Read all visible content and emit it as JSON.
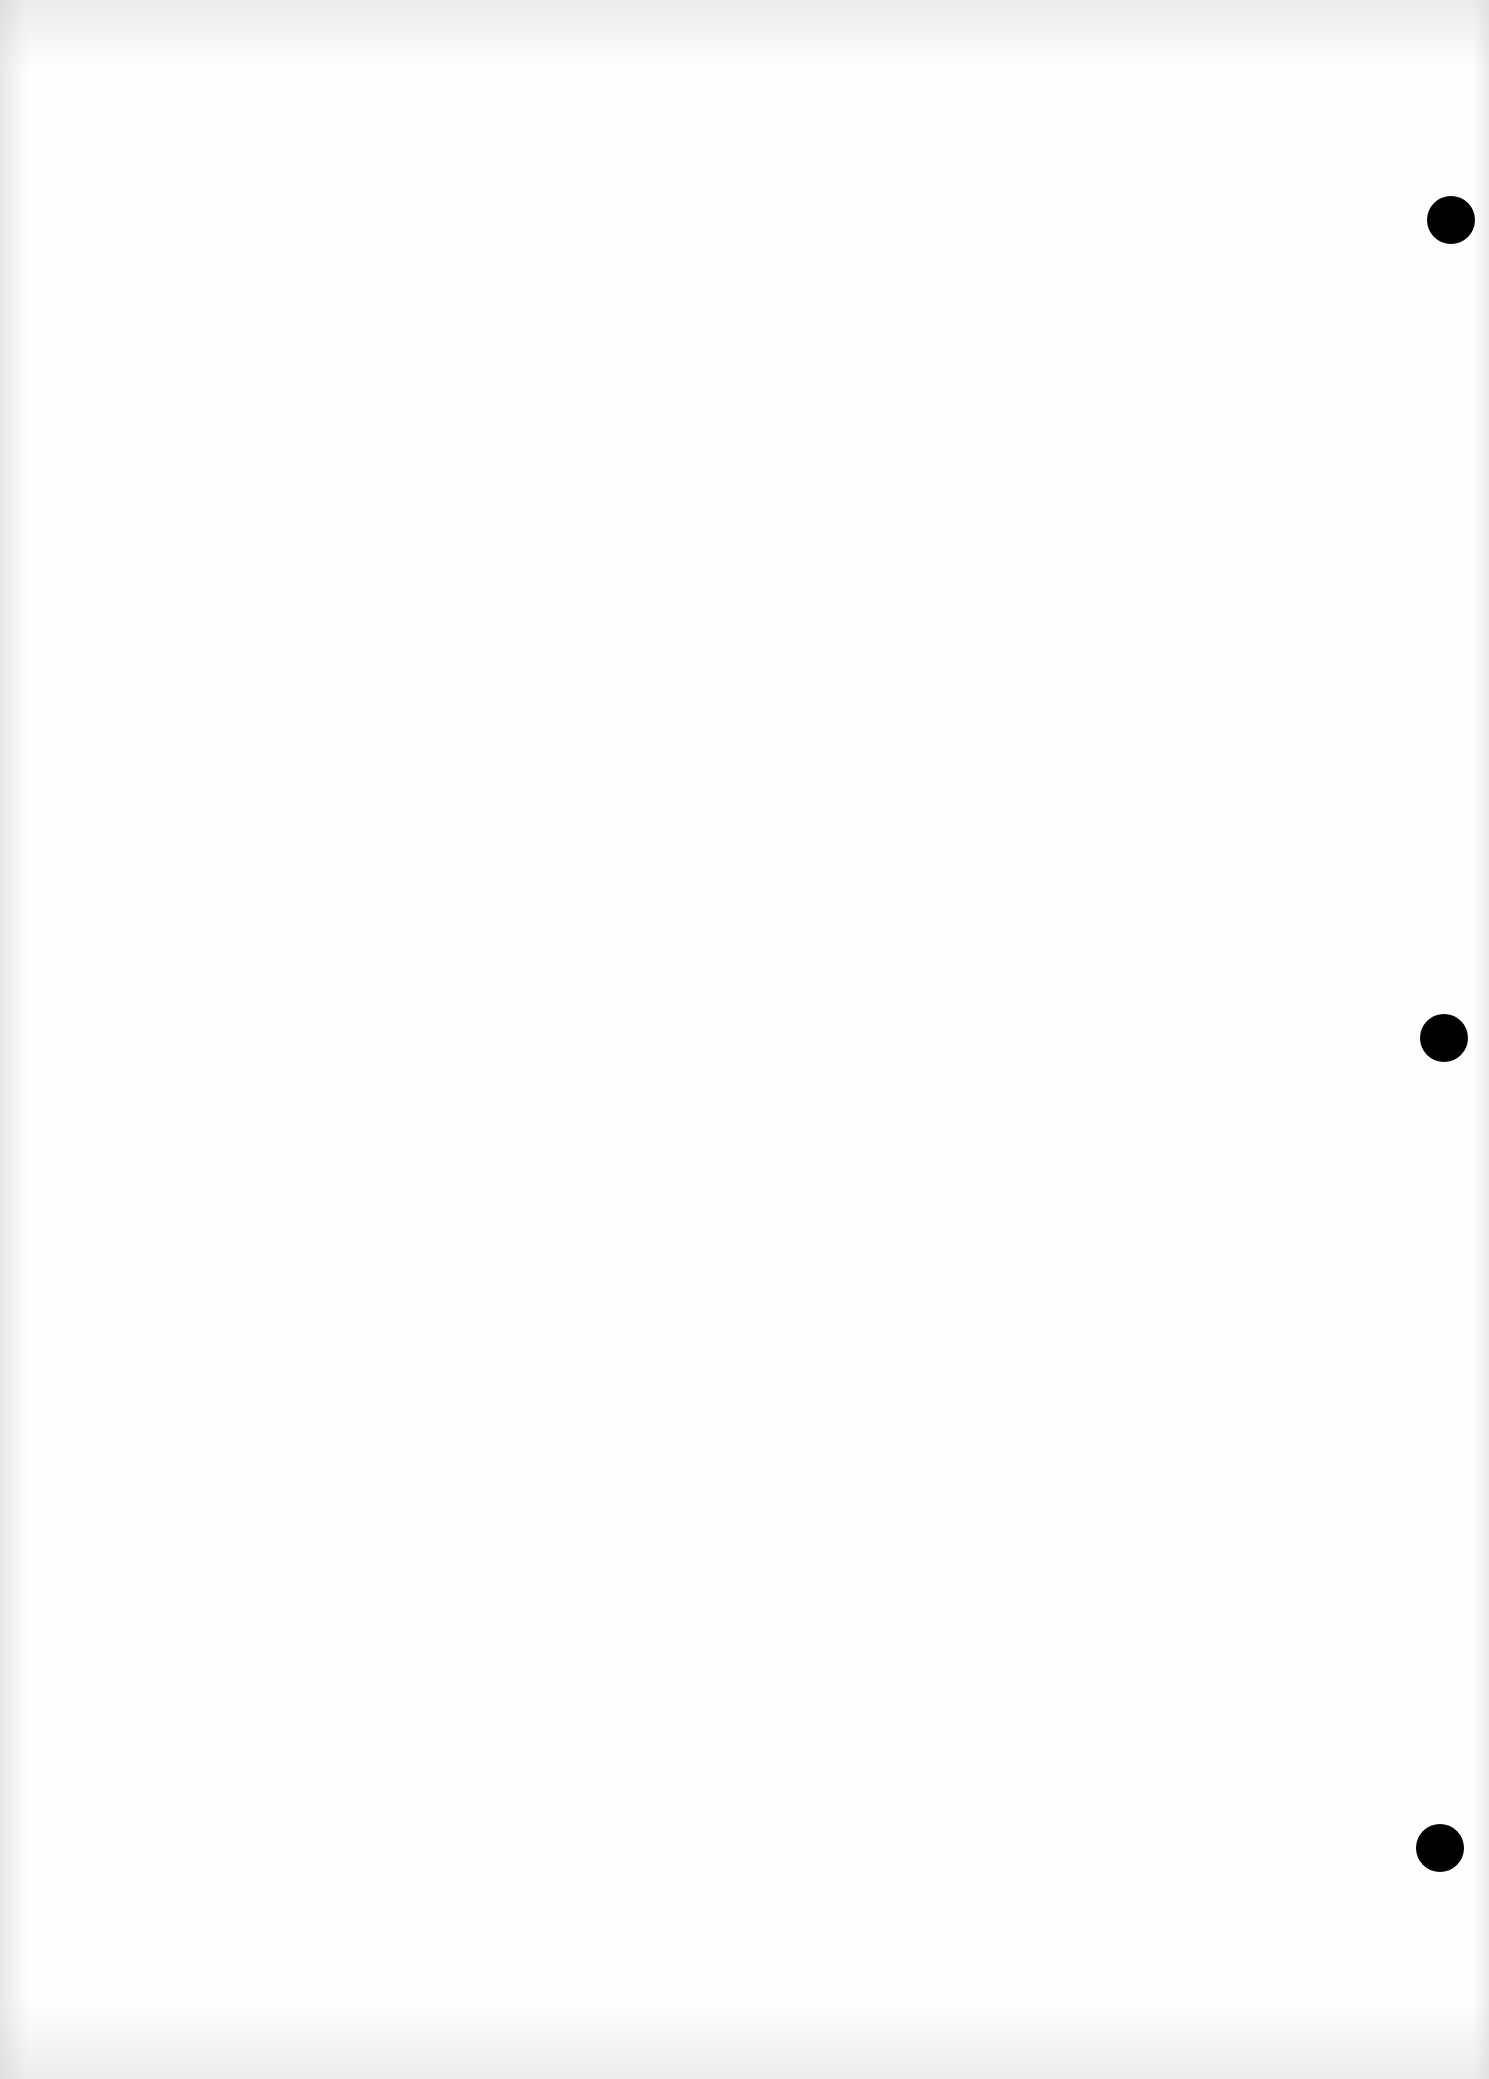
{
  "document": {
    "type": "blank scanned page",
    "text_content": "",
    "paper_color": "#fefefe",
    "punch_holes": [
      {
        "position": "top",
        "center": [
          1451,
          220
        ],
        "diameter": 48,
        "color": "#000000"
      },
      {
        "position": "middle",
        "center": [
          1444,
          1038
        ],
        "diameter": 48,
        "color": "#000000"
      },
      {
        "position": "bottom",
        "center": [
          1440,
          1848
        ],
        "diameter": 48,
        "color": "#000000"
      }
    ]
  }
}
